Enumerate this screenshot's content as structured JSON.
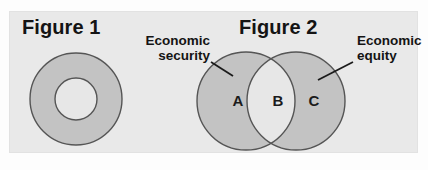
{
  "page": {
    "background_color": "#fdfdfd",
    "panel_color": "#e9e9e9"
  },
  "figures": [
    {
      "title": "Figure 1",
      "type": "annulus",
      "shape": {
        "outer_fill": "#c3c3c3",
        "inner_fill": "#e7e7e7",
        "stroke": "#555555",
        "center_x": 76,
        "center_y": 99,
        "outer_radius": 46,
        "inner_radius": 21
      }
    },
    {
      "title": "Figure 2",
      "type": "venn",
      "shape": {
        "circle_fill": "#c3c3c3",
        "overlap_fill": "#e7e7e7",
        "stroke": "#555555",
        "left_center_x": 246,
        "right_center_x": 296,
        "center_y": 101,
        "radius": 49
      },
      "callouts": [
        {
          "id": "economic-security",
          "line1": "Economic",
          "line2": "security",
          "leader": {
            "x1": 211,
            "y1": 62,
            "x2": 233,
            "y2": 76
          }
        },
        {
          "id": "economic-equity",
          "line1": "Economic",
          "line2": "equity",
          "leader": {
            "x1": 353,
            "y1": 62,
            "x2": 318,
            "y2": 80
          }
        }
      ],
      "region_labels": [
        {
          "id": "a",
          "text": "A"
        },
        {
          "id": "b",
          "text": "B"
        },
        {
          "id": "c",
          "text": "C"
        }
      ]
    }
  ]
}
